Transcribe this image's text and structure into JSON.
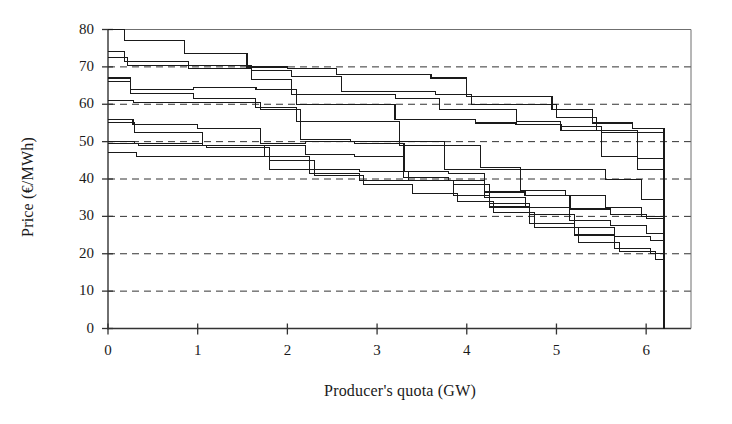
{
  "chart_data": {
    "type": "line",
    "subtype": "step-post",
    "title": "",
    "xlabel": "Producer's quota (GW)",
    "ylabel": "Price (€/MWh)",
    "xlim": [
      0,
      6.5
    ],
    "ylim": [
      0,
      80
    ],
    "xticks": [
      0,
      1,
      2,
      3,
      4,
      5,
      6
    ],
    "yticks": [
      0,
      10,
      20,
      30,
      40,
      50,
      60,
      70,
      80
    ],
    "xticklabels": [
      "0",
      "1",
      "2",
      "3",
      "4",
      "5",
      "6"
    ],
    "yticklabels": [
      "0",
      "10",
      "20",
      "30",
      "40",
      "50",
      "60",
      "70",
      "80"
    ],
    "grid": "horizontal-dashed",
    "legend": "none",
    "line_color": "#1a1a1a",
    "grid_color": "#333333",
    "axis_color": "#333333",
    "x_max_data": 6.2,
    "series": [
      {
        "name": "curve-1",
        "x": [
          0.0,
          0.18,
          0.85,
          1.55,
          2.0,
          2.55,
          3.1,
          3.6,
          4.0,
          4.45,
          4.95,
          5.4,
          5.85,
          6.2
        ],
        "y": [
          80.0,
          77.0,
          73.5,
          70.0,
          69.5,
          68.0,
          68.0,
          67.0,
          62.0,
          62.0,
          58.5,
          55.0,
          53.5,
          46.0
        ]
      },
      {
        "name": "curve-2",
        "x": [
          0.0,
          0.18,
          0.9,
          1.6,
          2.05,
          2.6,
          3.15,
          3.65,
          4.05,
          4.5,
          5.0,
          5.45,
          5.9,
          6.2
        ],
        "y": [
          74.0,
          71.5,
          70.5,
          69.0,
          67.5,
          63.5,
          63.5,
          62.5,
          60.0,
          60.0,
          56.5,
          53.0,
          52.5,
          44.5
        ]
      },
      {
        "name": "curve-3",
        "x": [
          0.0,
          0.22,
          0.9,
          1.6,
          2.05,
          2.6,
          3.2,
          3.7,
          4.1,
          4.55,
          5.05,
          5.5,
          5.9,
          6.2
        ],
        "y": [
          72.5,
          70.5,
          69.5,
          66.5,
          62.5,
          62.5,
          61.5,
          58.5,
          58.5,
          55.5,
          54.0,
          52.5,
          45.5,
          36.0
        ]
      },
      {
        "name": "curve-4",
        "x": [
          0.0,
          0.25,
          0.95,
          1.65,
          2.1,
          2.65,
          3.2,
          3.7,
          4.1,
          4.55,
          5.05,
          5.5,
          5.9,
          6.2
        ],
        "y": [
          67.0,
          64.0,
          64.5,
          64.0,
          60.0,
          60.0,
          56.0,
          56.0,
          55.0,
          54.5,
          53.0,
          46.0,
          42.5,
          34.0
        ]
      },
      {
        "name": "curve-5",
        "x": [
          0.0,
          0.25,
          0.95,
          1.65,
          2.1,
          2.7,
          3.25,
          3.75,
          4.15,
          4.6,
          5.1,
          5.55,
          5.95,
          6.2
        ],
        "y": [
          66.0,
          63.0,
          61.5,
          59.0,
          55.5,
          55.5,
          50.0,
          49.0,
          43.0,
          42.5,
          42.5,
          40.0,
          34.5,
          32.0
        ]
      },
      {
        "name": "curve-6",
        "x": [
          0.0,
          0.28,
          1.0,
          1.7,
          2.15,
          2.7,
          3.25,
          3.75,
          4.15,
          4.6,
          5.1,
          5.55,
          5.95,
          6.2
        ],
        "y": [
          61.0,
          60.5,
          60.5,
          58.5,
          50.5,
          50.0,
          49.0,
          42.5,
          42.5,
          37.0,
          35.5,
          32.5,
          30.0,
          29.5
        ]
      },
      {
        "name": "curve-7",
        "x": [
          0.0,
          0.28,
          1.0,
          1.7,
          2.2,
          2.75,
          3.3,
          3.8,
          4.2,
          4.65,
          5.15,
          5.6,
          6.0,
          6.2
        ],
        "y": [
          56.0,
          54.5,
          53.5,
          49.5,
          50.0,
          49.5,
          42.0,
          41.5,
          36.5,
          35.5,
          32.0,
          30.5,
          29.5,
          29.0
        ]
      },
      {
        "name": "curve-8",
        "x": [
          0.0,
          0.3,
          1.05,
          1.75,
          2.2,
          2.75,
          3.3,
          3.8,
          4.2,
          4.65,
          5.15,
          5.6,
          6.0,
          6.2
        ],
        "y": [
          55.0,
          52.5,
          49.0,
          49.0,
          46.5,
          46.0,
          40.5,
          39.5,
          35.0,
          32.5,
          29.0,
          27.5,
          25.5,
          24.5
        ]
      },
      {
        "name": "curve-9",
        "x": [
          0.0,
          0.3,
          1.05,
          1.75,
          2.25,
          2.8,
          3.35,
          3.85,
          4.25,
          4.7,
          5.2,
          5.65,
          6.05,
          6.2
        ],
        "y": [
          50.0,
          49.5,
          49.0,
          46.0,
          42.5,
          42.0,
          39.5,
          38.5,
          33.5,
          30.5,
          27.0,
          24.5,
          23.5,
          23.0
        ]
      },
      {
        "name": "curve-10",
        "x": [
          0.0,
          0.32,
          1.1,
          1.8,
          2.25,
          2.8,
          3.35,
          3.85,
          4.25,
          4.7,
          5.2,
          5.65,
          6.05,
          6.2
        ],
        "y": [
          47.0,
          46.0,
          46.0,
          42.5,
          41.5,
          39.5,
          39.5,
          35.5,
          32.5,
          28.0,
          25.0,
          21.5,
          20.0,
          19.0
        ]
      },
      {
        "name": "curve-11",
        "x": [
          0.0,
          0.34,
          1.1,
          1.8,
          2.3,
          2.85,
          3.4,
          3.9,
          4.3,
          4.75,
          5.25,
          5.7,
          6.1,
          6.2
        ],
        "y": [
          49.5,
          49.0,
          48.5,
          45.0,
          41.0,
          38.5,
          36.0,
          34.0,
          31.0,
          27.0,
          23.0,
          20.5,
          18.5,
          18.0
        ]
      }
    ]
  },
  "axes": {
    "y_title": "Price (€/MWh)",
    "x_title": "Producer's quota (GW)"
  }
}
